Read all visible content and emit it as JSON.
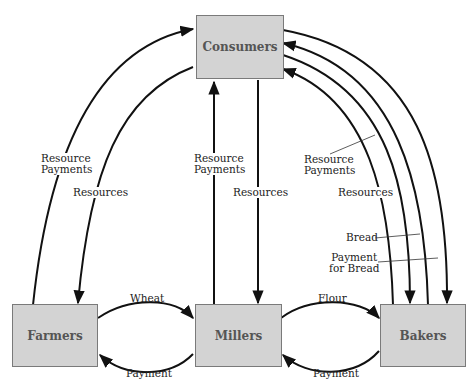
{
  "nodes": {
    "consumers": "Consumers",
    "farmers": "Farmers",
    "millers": "Millers",
    "bakers": "Bakers"
  },
  "labels": {
    "farmers_resource_payments_1": "Resource",
    "farmers_resource_payments_2": "Payments",
    "farmers_resources": "Resources",
    "millers_resource_payments_1": "Resource",
    "millers_resource_payments_2": "Payments",
    "millers_resources": "Resources",
    "bakers_resource_payments_1": "Resource",
    "bakers_resource_payments_2": "Payments",
    "bakers_resources": "Resources",
    "bread": "Bread",
    "payment_for_bread_1": "Payment",
    "payment_for_bread_2": "for Bread",
    "wheat": "Wheat",
    "farmers_payment": "Payment",
    "flour": "Flour",
    "millers_payment": "Payment"
  },
  "colors": {
    "box_fill": "#d3d3d3",
    "box_border": "#7a7a7a",
    "line": "#111111"
  }
}
